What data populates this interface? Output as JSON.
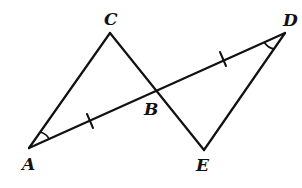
{
  "diagram": {
    "type": "geometry",
    "points": {
      "A": {
        "label": "A",
        "x": 29,
        "y": 148
      },
      "B": {
        "label": "B",
        "x": 156,
        "y": 90
      },
      "C": {
        "label": "C",
        "x": 110,
        "y": 33
      },
      "D": {
        "label": "D",
        "x": 285,
        "y": 33
      },
      "E": {
        "label": "E",
        "x": 204,
        "y": 150
      }
    },
    "labels": {
      "A": "A",
      "B": "B",
      "C": "C",
      "D": "D",
      "E": "E"
    },
    "segments": [
      "AC",
      "CE",
      "AD",
      "DE"
    ],
    "congruence_marks": {
      "AB": "single tick",
      "BD": "single tick"
    },
    "angle_marks": {
      "A": "single arc",
      "D": "single arc"
    },
    "colors": {
      "stroke": "#111111",
      "background": "#ffffff"
    }
  }
}
